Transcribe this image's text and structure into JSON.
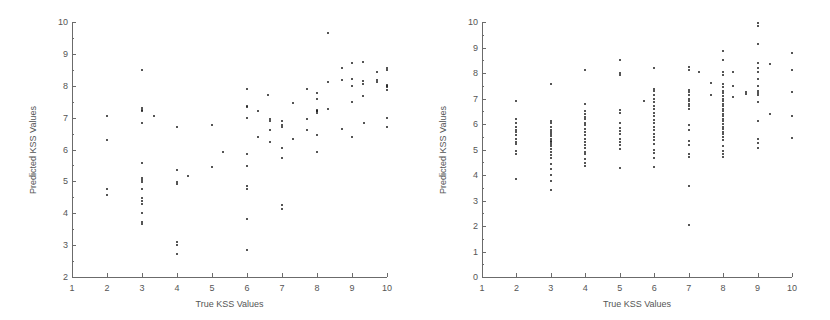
{
  "figure": {
    "background": "#ffffff",
    "marker_color": "#1c1c1c",
    "axis_color": "#6b6b6b",
    "text_color": "#555555"
  },
  "chart_data": [
    {
      "id": "left",
      "type": "scatter",
      "title": "",
      "xlabel": "True KSS Values",
      "ylabel": "Predicted KSS Values",
      "xlim": [
        1,
        10
      ],
      "ylim": [
        2,
        10
      ],
      "xticks": [
        1,
        2,
        3,
        4,
        5,
        6,
        7,
        8,
        9,
        10
      ],
      "yticks": [
        2,
        3,
        4,
        5,
        6,
        7,
        8,
        9,
        10
      ],
      "xticklabels": [
        "1",
        "2",
        "3",
        "4",
        "5",
        "6",
        "7",
        "8",
        "9",
        "10"
      ],
      "yticklabels": [
        "2",
        "3",
        "4",
        "5",
        "6",
        "7",
        "8",
        "9",
        "10"
      ],
      "grid": false,
      "legend": null,
      "marker": "dot",
      "points": [
        [
          2.0,
          7.05
        ],
        [
          2.0,
          6.3
        ],
        [
          2.0,
          4.75
        ],
        [
          2.0,
          4.58
        ],
        [
          3.0,
          8.5
        ],
        [
          3.0,
          7.3
        ],
        [
          3.0,
          7.25
        ],
        [
          3.0,
          7.2
        ],
        [
          3.0,
          6.82
        ],
        [
          3.0,
          5.57
        ],
        [
          3.0,
          5.12
        ],
        [
          3.0,
          5.05
        ],
        [
          3.0,
          4.98
        ],
        [
          3.0,
          4.77
        ],
        [
          3.0,
          4.48
        ],
        [
          3.0,
          4.38
        ],
        [
          3.0,
          4.28
        ],
        [
          3.0,
          4.0
        ],
        [
          3.0,
          3.72
        ],
        [
          3.0,
          3.65
        ],
        [
          3.35,
          7.06
        ],
        [
          4.0,
          6.7
        ],
        [
          4.0,
          5.35
        ],
        [
          4.0,
          4.97
        ],
        [
          4.0,
          4.93
        ],
        [
          4.0,
          3.1
        ],
        [
          4.0,
          3.0
        ],
        [
          4.0,
          2.72
        ],
        [
          4.3,
          5.18
        ],
        [
          5.0,
          6.78
        ],
        [
          5.0,
          5.45
        ],
        [
          5.3,
          5.92
        ],
        [
          6.0,
          7.9
        ],
        [
          6.0,
          7.38
        ],
        [
          6.0,
          7.32
        ],
        [
          6.0,
          7.0
        ],
        [
          6.0,
          5.85
        ],
        [
          6.0,
          5.48
        ],
        [
          6.0,
          4.85
        ],
        [
          6.0,
          4.75
        ],
        [
          6.0,
          3.83
        ],
        [
          6.0,
          2.85
        ],
        [
          6.3,
          7.22
        ],
        [
          6.3,
          6.4
        ],
        [
          6.6,
          7.7
        ],
        [
          6.65,
          6.95
        ],
        [
          6.65,
          6.88
        ],
        [
          6.65,
          6.6
        ],
        [
          6.65,
          6.22
        ],
        [
          7.0,
          6.88
        ],
        [
          7.0,
          6.78
        ],
        [
          7.0,
          6.72
        ],
        [
          7.0,
          6.05
        ],
        [
          7.0,
          5.72
        ],
        [
          7.0,
          4.25
        ],
        [
          7.0,
          4.13
        ],
        [
          7.3,
          7.47
        ],
        [
          7.3,
          6.32
        ],
        [
          7.7,
          7.9
        ],
        [
          7.7,
          6.95
        ],
        [
          7.7,
          6.6
        ],
        [
          8.0,
          7.78
        ],
        [
          8.0,
          7.6
        ],
        [
          8.0,
          7.25
        ],
        [
          8.0,
          7.22
        ],
        [
          8.0,
          7.2
        ],
        [
          8.0,
          7.15
        ],
        [
          8.0,
          6.45
        ],
        [
          8.0,
          5.93
        ],
        [
          8.3,
          8.12
        ],
        [
          8.3,
          7.28
        ],
        [
          8.3,
          9.65
        ],
        [
          8.7,
          8.55
        ],
        [
          8.7,
          8.18
        ],
        [
          8.7,
          6.65
        ],
        [
          9.0,
          8.7
        ],
        [
          9.0,
          8.2
        ],
        [
          9.0,
          8.0
        ],
        [
          9.0,
          7.48
        ],
        [
          9.0,
          6.38
        ],
        [
          9.3,
          8.75
        ],
        [
          9.3,
          8.15
        ],
        [
          9.3,
          8.05
        ],
        [
          9.3,
          7.68
        ],
        [
          9.35,
          6.82
        ],
        [
          9.7,
          8.42
        ],
        [
          9.7,
          8.18
        ],
        [
          9.7,
          8.12
        ],
        [
          10.0,
          8.55
        ],
        [
          10.0,
          8.5
        ],
        [
          10.0,
          8.02
        ],
        [
          10.0,
          7.98
        ],
        [
          10.0,
          7.95
        ],
        [
          10.0,
          7.88
        ],
        [
          10.0,
          6.98
        ],
        [
          10.0,
          6.72
        ]
      ]
    },
    {
      "id": "right",
      "type": "scatter",
      "title": "",
      "xlabel": "True KSS Values",
      "ylabel": "Predicted KSS Values",
      "xlim": [
        1,
        10
      ],
      "ylim": [
        0,
        10
      ],
      "xticks": [
        1,
        2,
        3,
        4,
        5,
        6,
        7,
        8,
        9,
        10
      ],
      "yticks": [
        0,
        1,
        2,
        3,
        4,
        5,
        6,
        7,
        8,
        9,
        10
      ],
      "xticklabels": [
        "1",
        "2",
        "3",
        "4",
        "5",
        "6",
        "7",
        "8",
        "9",
        "10"
      ],
      "yticklabels": [
        "0",
        "1",
        "2",
        "3",
        "4",
        "5",
        "6",
        "7",
        "8",
        "9",
        "10"
      ],
      "grid": false,
      "legend": null,
      "marker": "dot",
      "points": [
        [
          2.0,
          6.92
        ],
        [
          2.0,
          6.2
        ],
        [
          2.0,
          6.05
        ],
        [
          2.0,
          5.88
        ],
        [
          2.0,
          5.78
        ],
        [
          2.0,
          5.68
        ],
        [
          2.0,
          5.55
        ],
        [
          2.0,
          5.42
        ],
        [
          2.0,
          5.3
        ],
        [
          2.0,
          5.2
        ],
        [
          2.0,
          4.95
        ],
        [
          2.0,
          4.82
        ],
        [
          2.0,
          3.85
        ],
        [
          3.0,
          7.58
        ],
        [
          3.0,
          6.12
        ],
        [
          3.0,
          6.02
        ],
        [
          3.0,
          5.9
        ],
        [
          3.0,
          5.78
        ],
        [
          3.0,
          5.7
        ],
        [
          3.0,
          5.6
        ],
        [
          3.0,
          5.52
        ],
        [
          3.0,
          5.42
        ],
        [
          3.0,
          5.35
        ],
        [
          3.0,
          5.28
        ],
        [
          3.0,
          5.2
        ],
        [
          3.0,
          5.12
        ],
        [
          3.0,
          5.02
        ],
        [
          3.0,
          4.92
        ],
        [
          3.0,
          4.78
        ],
        [
          3.0,
          4.68
        ],
        [
          3.0,
          4.45
        ],
        [
          3.0,
          4.22
        ],
        [
          3.0,
          4.0
        ],
        [
          3.0,
          3.78
        ],
        [
          3.0,
          3.42
        ],
        [
          4.0,
          8.1
        ],
        [
          4.0,
          6.8
        ],
        [
          4.0,
          6.5
        ],
        [
          4.0,
          6.4
        ],
        [
          4.0,
          6.28
        ],
        [
          4.0,
          6.18
        ],
        [
          4.0,
          6.05
        ],
        [
          4.0,
          5.95
        ],
        [
          4.0,
          5.82
        ],
        [
          4.0,
          5.7
        ],
        [
          4.0,
          5.58
        ],
        [
          4.0,
          5.42
        ],
        [
          4.0,
          5.3
        ],
        [
          4.0,
          5.18
        ],
        [
          4.0,
          5.05
        ],
        [
          4.0,
          4.92
        ],
        [
          4.0,
          4.82
        ],
        [
          4.0,
          4.62
        ],
        [
          4.0,
          4.48
        ],
        [
          4.0,
          4.35
        ],
        [
          5.0,
          8.5
        ],
        [
          5.0,
          8.0
        ],
        [
          5.0,
          7.92
        ],
        [
          5.0,
          6.55
        ],
        [
          5.0,
          6.42
        ],
        [
          5.0,
          6.05
        ],
        [
          5.0,
          5.85
        ],
        [
          5.0,
          5.72
        ],
        [
          5.0,
          5.6
        ],
        [
          5.0,
          5.42
        ],
        [
          5.0,
          5.3
        ],
        [
          5.0,
          5.18
        ],
        [
          5.0,
          5.02
        ],
        [
          5.0,
          4.28
        ],
        [
          5.7,
          6.92
        ],
        [
          6.0,
          8.2
        ],
        [
          6.0,
          7.38
        ],
        [
          6.0,
          7.28
        ],
        [
          6.0,
          7.12
        ],
        [
          6.0,
          7.0
        ],
        [
          6.0,
          6.85
        ],
        [
          6.0,
          6.72
        ],
        [
          6.0,
          6.6
        ],
        [
          6.0,
          6.45
        ],
        [
          6.0,
          6.3
        ],
        [
          6.0,
          6.15
        ],
        [
          6.0,
          6.02
        ],
        [
          6.0,
          5.9
        ],
        [
          6.0,
          5.75
        ],
        [
          6.0,
          5.6
        ],
        [
          6.0,
          5.48
        ],
        [
          6.0,
          5.38
        ],
        [
          6.0,
          5.2
        ],
        [
          6.0,
          4.98
        ],
        [
          6.0,
          4.85
        ],
        [
          6.0,
          4.68
        ],
        [
          6.0,
          4.32
        ],
        [
          7.0,
          8.22
        ],
        [
          7.0,
          8.1
        ],
        [
          7.0,
          7.35
        ],
        [
          7.0,
          7.25
        ],
        [
          7.0,
          7.12
        ],
        [
          7.0,
          7.0
        ],
        [
          7.0,
          6.9
        ],
        [
          7.0,
          6.8
        ],
        [
          7.0,
          6.7
        ],
        [
          7.0,
          6.58
        ],
        [
          7.0,
          5.98
        ],
        [
          7.0,
          5.78
        ],
        [
          7.0,
          5.35
        ],
        [
          7.0,
          5.18
        ],
        [
          7.0,
          4.82
        ],
        [
          7.0,
          4.7
        ],
        [
          7.0,
          3.58
        ],
        [
          7.0,
          2.05
        ],
        [
          7.3,
          8.05
        ],
        [
          7.65,
          7.6
        ],
        [
          7.65,
          7.15
        ],
        [
          8.0,
          8.85
        ],
        [
          8.0,
          8.5
        ],
        [
          8.0,
          8.05
        ],
        [
          8.0,
          7.92
        ],
        [
          8.0,
          7.58
        ],
        [
          8.0,
          7.45
        ],
        [
          8.0,
          7.3
        ],
        [
          8.0,
          7.2
        ],
        [
          8.0,
          7.1
        ],
        [
          8.0,
          7.0
        ],
        [
          8.0,
          6.9
        ],
        [
          8.0,
          6.8
        ],
        [
          8.0,
          6.7
        ],
        [
          8.0,
          6.6
        ],
        [
          8.0,
          6.5
        ],
        [
          8.0,
          6.4
        ],
        [
          8.0,
          6.3
        ],
        [
          8.0,
          6.2
        ],
        [
          8.0,
          6.1
        ],
        [
          8.0,
          6.0
        ],
        [
          8.0,
          5.9
        ],
        [
          8.0,
          5.8
        ],
        [
          8.0,
          5.7
        ],
        [
          8.0,
          5.6
        ],
        [
          8.0,
          5.5
        ],
        [
          8.0,
          5.38
        ],
        [
          8.0,
          5.12
        ],
        [
          8.0,
          4.95
        ],
        [
          8.0,
          4.82
        ],
        [
          8.0,
          4.7
        ],
        [
          8.3,
          8.05
        ],
        [
          8.3,
          7.48
        ],
        [
          8.3,
          7.05
        ],
        [
          8.65,
          7.25
        ],
        [
          8.65,
          7.18
        ],
        [
          9.0,
          9.95
        ],
        [
          9.0,
          9.85
        ],
        [
          9.0,
          9.12
        ],
        [
          9.0,
          8.38
        ],
        [
          9.0,
          8.18
        ],
        [
          9.0,
          8.02
        ],
        [
          9.0,
          7.78
        ],
        [
          9.0,
          7.5
        ],
        [
          9.0,
          7.3
        ],
        [
          9.0,
          7.22
        ],
        [
          9.0,
          7.12
        ],
        [
          9.0,
          6.85
        ],
        [
          9.0,
          6.1
        ],
        [
          9.0,
          5.4
        ],
        [
          9.0,
          5.25
        ],
        [
          9.0,
          5.05
        ],
        [
          9.35,
          8.35
        ],
        [
          9.35,
          6.4
        ],
        [
          10.0,
          8.78
        ],
        [
          10.0,
          8.12
        ],
        [
          10.0,
          7.25
        ],
        [
          10.0,
          6.32
        ],
        [
          10.0,
          5.45
        ]
      ]
    }
  ]
}
